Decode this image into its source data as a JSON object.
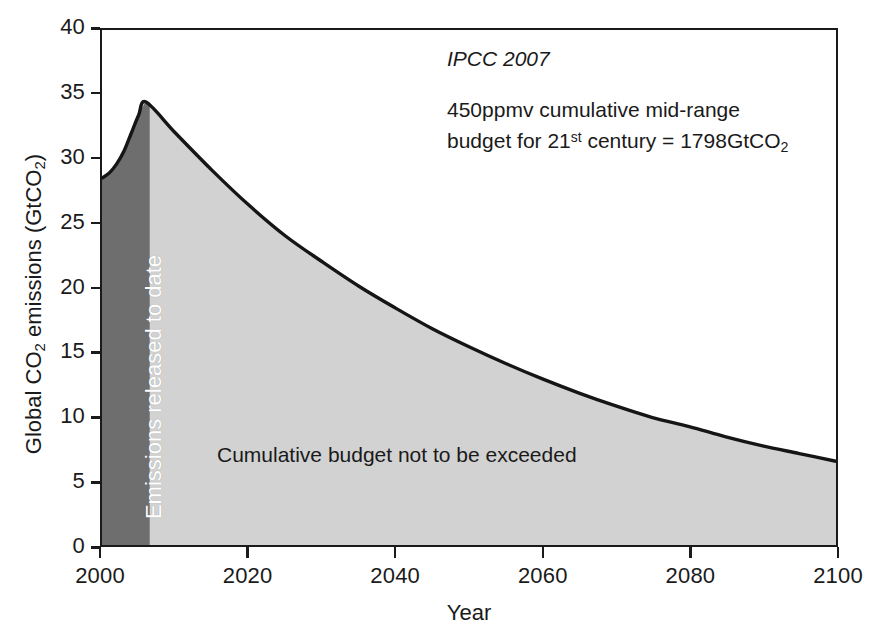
{
  "chart_data": {
    "type": "area",
    "title": "",
    "xlabel": "Year",
    "ylabel": "Global CO2 emissions (GtCO2)",
    "ylabel_parts": {
      "prefix": "Global CO",
      "sub1": "2",
      "middle": " emissions (GtCO",
      "sub2": "2",
      "suffix": ")"
    },
    "xlim": [
      2000,
      2100
    ],
    "ylim": [
      0,
      40
    ],
    "xticks": [
      2000,
      2020,
      2040,
      2060,
      2080,
      2100
    ],
    "yticks": [
      0,
      5,
      10,
      15,
      20,
      25,
      30,
      35,
      40
    ],
    "grid": false,
    "legend": "none",
    "series": [
      {
        "name": "Global CO2 emissions pathway",
        "x": [
          2000,
          2001,
          2002,
          2003,
          2004,
          2005,
          2006,
          2010,
          2015,
          2020,
          2025,
          2030,
          2035,
          2040,
          2045,
          2050,
          2055,
          2060,
          2065,
          2070,
          2075,
          2080,
          2085,
          2090,
          2095,
          2100
        ],
        "values": [
          28.5,
          28.9,
          29.6,
          30.6,
          32.0,
          33.4,
          34.4,
          32.0,
          29.1,
          26.4,
          24.0,
          22.0,
          20.1,
          18.4,
          16.8,
          15.4,
          14.1,
          12.9,
          11.8,
          10.8,
          9.9,
          9.2,
          8.4,
          7.7,
          7.1,
          6.5
        ]
      }
    ],
    "regions": [
      {
        "name": "emissions-released-to-date",
        "label": "Emissions released to date",
        "x_start": 2000,
        "x_end": 2006.5,
        "fill": "#6e6e6e",
        "text_color": "#ffffff"
      },
      {
        "name": "cumulative-budget",
        "label": "Cumulative budget not to be exceeded",
        "x_start": 2006.5,
        "x_end": 2100,
        "fill": "#d2d2d2",
        "text_color": "#1a1a1a"
      }
    ],
    "annotations": {
      "source": "IPCC 2007",
      "budget_line1": "450ppmv cumulative mid-range",
      "budget_line2_pre": "budget for 21",
      "budget_line2_sup": "st",
      "budget_line2_post": " century = 1798GtCO",
      "budget_line2_sub": "2"
    },
    "colors": {
      "curve": "#151515",
      "dark_band": "#6e6e6e",
      "light_fill": "#d2d2d2",
      "axis": "#1a1a1a",
      "background": "#ffffff"
    }
  },
  "axes": {
    "x_title": "Year",
    "y_ticks": [
      "40",
      "35",
      "30",
      "25",
      "20",
      "15",
      "10",
      "5",
      "0"
    ],
    "x_ticks": [
      "2000",
      "2020",
      "2040",
      "2060",
      "2080",
      "2100"
    ]
  },
  "labels": {
    "band_label": "Emissions released to date",
    "budget_label": "Cumulative budget not to be exceeded"
  }
}
